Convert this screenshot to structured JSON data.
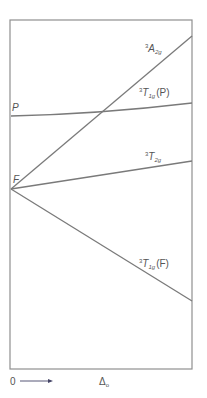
{
  "diagram": {
    "type": "orgel-energy-level-diagram",
    "frame": {
      "x1": 10,
      "y1": 20,
      "x2": 192,
      "y2": 369
    },
    "free_ion_terms": [
      {
        "id": "P",
        "label": "P",
        "y": 116
      },
      {
        "id": "F",
        "label": "F",
        "y": 189
      }
    ],
    "states": [
      {
        "id": "A2g",
        "sup": "3",
        "main": "A",
        "sub": "2g",
        "suffix": "",
        "from": [
          11,
          189
        ],
        "to": [
          192,
          36
        ]
      },
      {
        "id": "T1gP",
        "sup": "3",
        "main": "T",
        "sub": "1g",
        "suffix": "(P)",
        "from": [
          11,
          116
        ],
        "to": [
          192,
          103
        ]
      },
      {
        "id": "T2g",
        "sup": "3",
        "main": "T",
        "sub": "2g",
        "suffix": "",
        "from": [
          11,
          189
        ],
        "to": [
          192,
          161
        ]
      },
      {
        "id": "T1gF",
        "sup": "3",
        "main": "T",
        "sub": "1g",
        "suffix": "(F)",
        "from": [
          11,
          189
        ],
        "to": [
          192,
          301
        ]
      }
    ],
    "axis": {
      "origin_label": "0",
      "x_label_main": "Δ",
      "x_label_sub": "o"
    },
    "colors": {
      "line": "#7a7a7a",
      "frame": "#8f8f8f",
      "text": "#555555",
      "arrow": "#444466"
    }
  }
}
